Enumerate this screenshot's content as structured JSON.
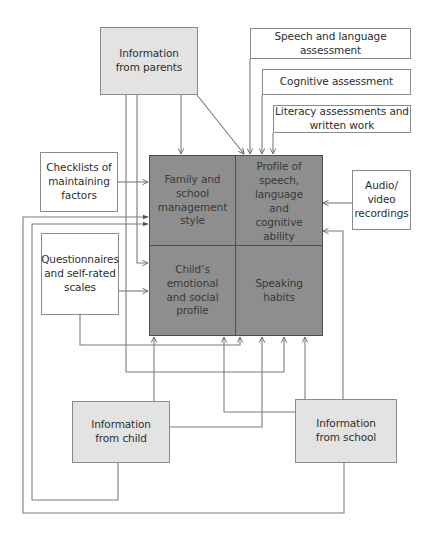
{
  "diagram": {
    "type": "flow",
    "colors": {
      "source_fill": "#e3e3e3",
      "core_fill": "#8e8e8e",
      "tool_fill": "#ffffff",
      "line": "#777777"
    },
    "sources": {
      "parents": "Information\nfrom parents",
      "child": "Information\nfrom child",
      "school": "Information\nfrom school"
    },
    "tools": {
      "speech_language": "Speech and language\nassessment",
      "cognitive": "Cognitive assessment",
      "literacy": "Literacy assessments and\nwritten work",
      "checklists": "Checklists of\nmaintaining\nfactors",
      "audio_video": "Audio/\nvideo\nrecordings",
      "questionnaires": "Questionnaires\nand self-rated\nscales"
    },
    "core": {
      "family_school": "Family and\nschool\nmanagement\nstyle",
      "profile_speech": "Profile of speech,\nlanguage\nand\ncognitive\nability",
      "emotional_social": "Child’s\nemotional\nand social\nprofile",
      "speaking_habits": "Speaking\nhabits"
    },
    "edges": [
      {
        "from": "Information from parents",
        "to": "Family and school management style"
      },
      {
        "from": "Information from parents",
        "to": "Profile of speech, language and cognitive ability"
      },
      {
        "from": "Information from parents",
        "to": "Child’s emotional and social profile"
      },
      {
        "from": "Information from parents",
        "to": "Speaking habits"
      },
      {
        "from": "Speech and language assessment",
        "to": "Profile of speech, language and cognitive ability"
      },
      {
        "from": "Cognitive assessment",
        "to": "Profile of speech, language and cognitive ability"
      },
      {
        "from": "Literacy assessments and written work",
        "to": "Profile of speech, language and cognitive ability"
      },
      {
        "from": "Checklists of maintaining factors",
        "to": "Family and school management style"
      },
      {
        "from": "Audio/video recordings",
        "to": "Profile of speech, language and cognitive ability"
      },
      {
        "from": "Questionnaires and self-rated scales",
        "to": "Child’s emotional and social profile"
      },
      {
        "from": "Questionnaires and self-rated scales",
        "to": "Speaking habits"
      },
      {
        "from": "Information from child",
        "to": "Child’s emotional and social profile"
      },
      {
        "from": "Information from child",
        "to": "Speaking habits"
      },
      {
        "from": "Information from child",
        "to": "Family and school management style"
      },
      {
        "from": "Information from school",
        "to": "Speaking habits"
      },
      {
        "from": "Information from school",
        "to": "Child’s emotional and social profile"
      },
      {
        "from": "Information from school",
        "to": "Profile of speech, language and cognitive ability"
      },
      {
        "from": "Information from school",
        "to": "Family and school management style"
      }
    ]
  }
}
